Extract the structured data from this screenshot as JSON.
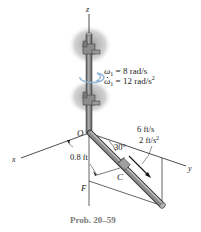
{
  "figure": {
    "axes": {
      "z": "z",
      "x": "x",
      "y": "y"
    },
    "points": {
      "origin": "O",
      "collar": "C",
      "foot": "F"
    },
    "shaft": {
      "omega_label": "ω",
      "omega_sub": "1",
      "omega_value": " = 8 rad/s",
      "omega_dot_value": " = 12 rad/s",
      "omega_dot_exp": "2"
    },
    "collar_motion": {
      "velocity": "6 ft/s",
      "acceleration": "2 ft/s",
      "acceleration_exp": "2"
    },
    "dimensions": {
      "distance": "0.8 ft",
      "angle": "30°"
    },
    "caption": "Prob. 20–59",
    "colors": {
      "rod": "#7d7d7d",
      "rod_dark": "#4a4a4a",
      "shadow": "#9a9a9a",
      "line": "#222222",
      "caption": "#7a7a7a",
      "arrow": "#8fb6d8"
    }
  }
}
